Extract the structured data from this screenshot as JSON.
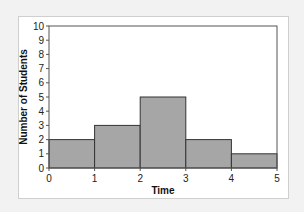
{
  "chart_data": {
    "type": "bar",
    "subtype": "histogram",
    "title": "",
    "xlabel": "Time",
    "ylabel": "Number of Students",
    "bins": [
      [
        0,
        1
      ],
      [
        1,
        2
      ],
      [
        2,
        3
      ],
      [
        3,
        4
      ],
      [
        4,
        5
      ]
    ],
    "categories": [
      "0-1",
      "1-2",
      "2-3",
      "3-4",
      "4-5"
    ],
    "values": [
      2,
      3,
      5,
      2,
      1
    ],
    "x_ticks": [
      "0",
      "1",
      "2",
      "3",
      "4",
      "5"
    ],
    "y_ticks": [
      "0",
      "1",
      "2",
      "3",
      "4",
      "5",
      "6",
      "7",
      "8",
      "9",
      "10"
    ],
    "xlim": [
      0,
      5
    ],
    "ylim": [
      0,
      10
    ],
    "grid": false,
    "legend": null,
    "colors": {
      "bar": "#a6a6a6",
      "bar_edge": "#333333",
      "background": "#f2f2f2",
      "panel": "#ffffff"
    }
  }
}
